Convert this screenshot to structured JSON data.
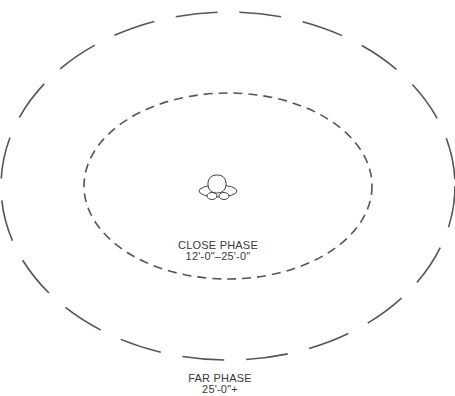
{
  "diagram": {
    "zones": [
      {
        "id": "close",
        "name": "CLOSE PHASE",
        "range": "12'-0\"–25'-0\"",
        "style": "short-dash"
      },
      {
        "id": "far",
        "name": "FAR PHASE",
        "range": "25'-0\"+",
        "style": "long-dash"
      }
    ],
    "center_figure": "person-top-view-icon",
    "line_color": "#555555"
  }
}
